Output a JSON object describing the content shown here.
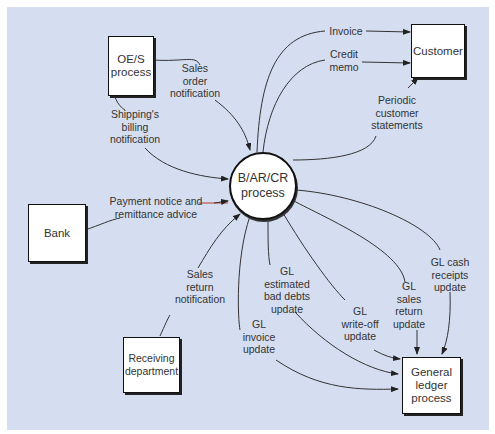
{
  "caption": "Figure — Data flow diagram",
  "colors": {
    "background": "#d5def0",
    "box_fill": "#ffffff",
    "stroke": "#222222",
    "accent_flow": "#c0392b"
  },
  "nodes": {
    "oes": {
      "label": "OE/S\nprocess",
      "type": "external-process"
    },
    "customer": {
      "label": "Customer",
      "type": "external-entity"
    },
    "bank": {
      "label": "Bank",
      "type": "external-entity"
    },
    "receiving": {
      "label": "Receiving\ndepartment",
      "type": "external-entity"
    },
    "gl": {
      "label": "General\nledger\nprocess",
      "type": "external-process"
    },
    "barcr": {
      "label": "B/AR/CR\nprocess",
      "type": "process"
    }
  },
  "flows": {
    "sales_order": "Sales\norder\nnotification",
    "shipping_billing": "Shipping's\nbilling\nnotification",
    "invoice": "Invoice",
    "credit_memo": "Credit\nmemo",
    "periodic_statements": "Periodic\ncustomer\nstatements",
    "payment_notice": "Payment notice and\nremittance advice",
    "sales_return_notification": "Sales\nreturn\nnotification",
    "gl_bad_debts": "GL\nestimated\nbad debts\nupdate",
    "gl_invoice": "GL\ninvoice\nupdate",
    "gl_write_off": "GL\nwrite-off\nupdate",
    "gl_sales_return": "GL\nsales\nreturn\nupdate",
    "gl_cash_receipts": "GL cash\nreceipts\nupdate"
  }
}
